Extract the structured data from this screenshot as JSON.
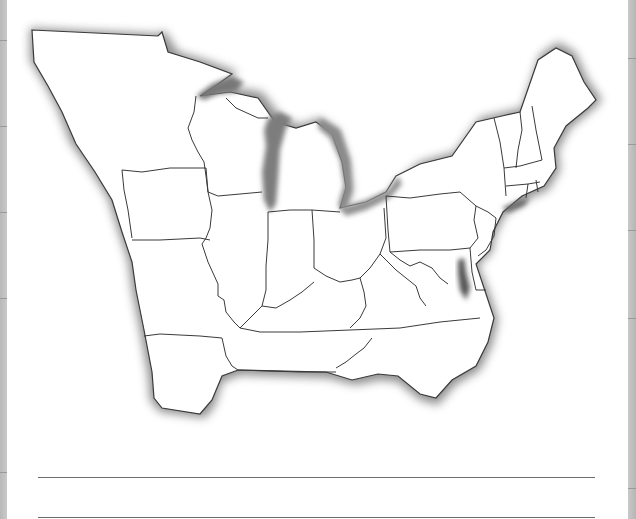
{
  "worksheet": {
    "type": "blank outline map",
    "region": "Eastern United States",
    "answer_lines_count": 2,
    "colors": {
      "land": "#ffffff",
      "coast_shading": "#555555",
      "border_lines": "#333333",
      "answer_lines": "#6e6e6e",
      "side_strips": "#c0c0c0"
    }
  }
}
